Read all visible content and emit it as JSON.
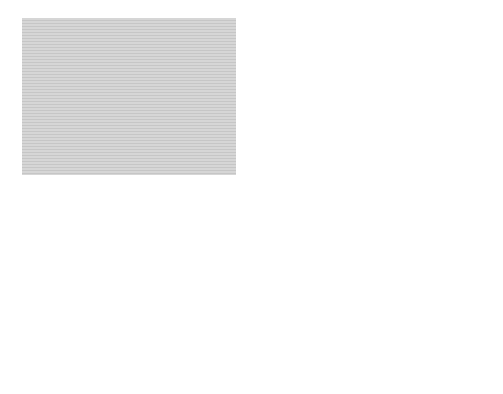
{
  "colors": {
    "background": "#d4d4d4",
    "stripe": "#c8c8c8",
    "line": "#3a3a3a",
    "text": "#1a1a1a",
    "circle_fill": "#ffffff"
  },
  "top_chart": {
    "y_axis_title_line1": "Finished-product",
    "y_axis_title_line2": "inventory level",
    "reorder_point_line1": "Reorder",
    "reorder_point_line2": "point",
    "safety_stock_line1": "Safety",
    "safety_stock_line2": "stock",
    "production_phase_line1": "Production",
    "production_phase_line2": "phase",
    "production_lead_time_line1": "Production",
    "production_lead_time_line2": "lead time",
    "x_axis_label": "Time"
  },
  "markers": {
    "a": "A",
    "c": "C"
  },
  "bottom_chart": {
    "y_axis_title_line1": "Purchased-part",
    "y_axis_title_line2": "inventory level",
    "reorder_point_line1": "Reorder",
    "reorder_point_line2": "point",
    "order_note_line1": "Purchased-part order",
    "order_note_line2": "placed with arrival",
    "order_note_line3_prefix": "scheduled at time ",
    "order_note_line3_italic": "C",
    "lead_time_line1": "Lead time for",
    "lead_time_line2": "purchased-part",
    "x_axis_label": "Time"
  }
}
